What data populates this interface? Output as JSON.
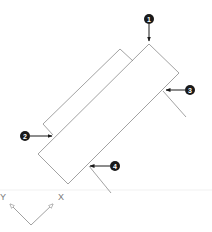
{
  "diagram": {
    "callouts": [
      {
        "id": "1",
        "label": "1"
      },
      {
        "id": "2",
        "label": "2"
      },
      {
        "id": "3",
        "label": "3"
      },
      {
        "id": "4",
        "label": "4"
      }
    ],
    "ucs": {
      "x_label": "X",
      "y_label": "Y"
    },
    "colors": {
      "lines": "#8a8a8a",
      "callout": "#1a1a1a",
      "background": "#ffffff"
    }
  }
}
